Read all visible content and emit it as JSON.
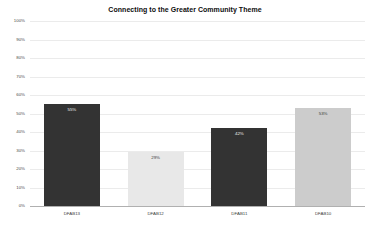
{
  "chart_data": {
    "type": "bar",
    "title": "Connecting to the Greater Community Theme",
    "xlabel": "",
    "ylabel": "",
    "ylim": [
      0,
      100
    ],
    "grid": true,
    "legend": "none",
    "categories": [
      "DFAB13",
      "DFAB12",
      "DFAB11",
      "DFAB10"
    ],
    "values": [
      55,
      29,
      42,
      53
    ],
    "value_labels": [
      "55%",
      "29%",
      "42%",
      "53%"
    ],
    "bar_colors": [
      "#333333",
      "#e8e8e8",
      "#333333",
      "#cccccc"
    ],
    "label_text_colors": [
      "#f2f2f2",
      "#3a3a3a",
      "#f2f2f2",
      "#3a3a3a"
    ],
    "y_ticks": [
      0,
      10,
      20,
      30,
      40,
      50,
      60,
      70,
      80,
      90,
      100
    ],
    "y_tick_labels": [
      "0%",
      "10%",
      "20%",
      "30%",
      "40%",
      "50%",
      "60%",
      "70%",
      "80%",
      "90%",
      "100%"
    ]
  },
  "colors": {
    "background": "#ffffff",
    "gridline": "#ebebeb",
    "axis_line": "#b0b0b0",
    "title_text": "#0d0d0d",
    "tick_text": "#3d3d3d"
  }
}
